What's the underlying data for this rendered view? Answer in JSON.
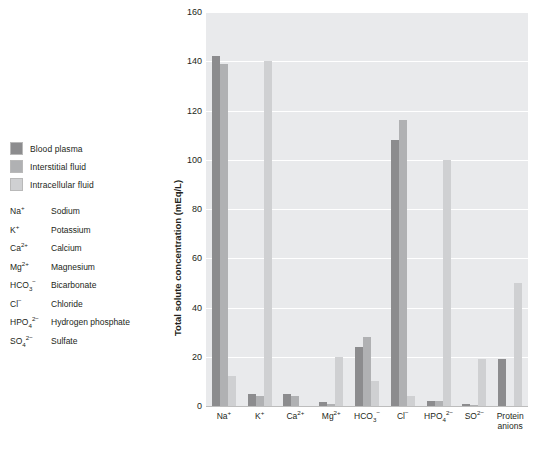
{
  "legend": {
    "items": [
      {
        "label": "Blood plasma",
        "color": "#8c8c8e"
      },
      {
        "label": "Interstitial fluid",
        "color": "#b0b1b3"
      },
      {
        "label": "Intracellular fluid",
        "color": "#cfd0d2"
      }
    ]
  },
  "key": {
    "items": [
      {
        "symbol": "Na",
        "charge": "+",
        "sub": "",
        "name": "Sodium"
      },
      {
        "symbol": "K",
        "charge": "+",
        "sub": "",
        "name": "Potassium"
      },
      {
        "symbol": "Ca",
        "charge": "2+",
        "sub": "",
        "name": "Calcium"
      },
      {
        "symbol": "Mg",
        "charge": "2+",
        "sub": "",
        "name": "Magnesium"
      },
      {
        "symbol": "HCO",
        "charge": "−",
        "sub": "3",
        "name": "Bicarbonate"
      },
      {
        "symbol": "Cl",
        "charge": "−",
        "sub": "",
        "name": "Chloride"
      },
      {
        "symbol": "HPO",
        "charge": "2−",
        "sub": "4",
        "name": "Hydrogen phosphate"
      },
      {
        "symbol": "SO",
        "charge": "2−",
        "sub": "4",
        "name": "Sulfate"
      }
    ]
  },
  "chart_data": {
    "type": "bar",
    "title": "",
    "xlabel": "",
    "ylabel": "Total solute concentration (mEq/L)",
    "ylim": [
      0,
      160
    ],
    "yticks": [
      0,
      20,
      40,
      60,
      80,
      100,
      120,
      140,
      160
    ],
    "grid": true,
    "legend_position": "outside-left",
    "categories": [
      {
        "symbol": "Na",
        "charge": "+",
        "sub": ""
      },
      {
        "symbol": "K",
        "charge": "+",
        "sub": ""
      },
      {
        "symbol": "Ca",
        "charge": "2+",
        "sub": ""
      },
      {
        "symbol": "Mg",
        "charge": "2+",
        "sub": ""
      },
      {
        "symbol": "HCO",
        "charge": "−",
        "sub": "3"
      },
      {
        "symbol": "Cl",
        "charge": "−",
        "sub": ""
      },
      {
        "symbol": "HPO",
        "charge": "2−",
        "sub": "4"
      },
      {
        "symbol": "SO",
        "charge": "2−",
        "sub": ""
      },
      {
        "symbol": "Protein",
        "charge": "",
        "sub": "",
        "line2": "anions"
      }
    ],
    "series": [
      {
        "name": "Blood plasma",
        "color": "#8c8c8e",
        "values": [
          142,
          5,
          5,
          1.5,
          24,
          108,
          2,
          1,
          19
        ]
      },
      {
        "name": "Interstitial fluid",
        "color": "#b0b1b3",
        "values": [
          139,
          4,
          4,
          1,
          28,
          116,
          2,
          0.5,
          0
        ]
      },
      {
        "name": "Intracellular fluid",
        "color": "#cfd0d2",
        "values": [
          12,
          140,
          0,
          20,
          10,
          4,
          100,
          19,
          50
        ]
      }
    ]
  }
}
